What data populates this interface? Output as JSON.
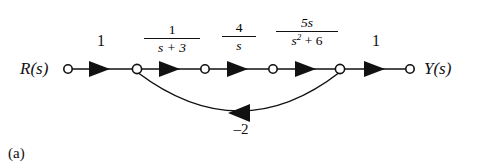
{
  "figure": {
    "caption": "(a)",
    "background": "#ffffff",
    "stroke_color": "#111111"
  },
  "graph": {
    "input_label": "R(s)",
    "output_label": "Y(s)",
    "nodes": [
      {
        "id": "n1",
        "name": "input-node",
        "x": 68,
        "y": 69
      },
      {
        "id": "n2",
        "name": "node-2",
        "x": 137,
        "y": 69
      },
      {
        "id": "n3",
        "name": "node-3",
        "x": 205,
        "y": 69
      },
      {
        "id": "n4",
        "name": "node-4",
        "x": 273,
        "y": 69
      },
      {
        "id": "n5",
        "name": "node-5",
        "x": 340,
        "y": 69
      },
      {
        "id": "n6",
        "name": "output-node",
        "x": 410,
        "y": 69
      }
    ],
    "branches": [
      {
        "from": "n1",
        "to": "n2",
        "gain_type": "simple",
        "gain": "1",
        "label_x": 100,
        "label_y": 40
      },
      {
        "from": "n2",
        "to": "n3",
        "gain_type": "fraction",
        "numerator": "1",
        "denominator": "s + 3",
        "label_x": 171,
        "label_y": 26
      },
      {
        "from": "n3",
        "to": "n4",
        "gain_type": "fraction",
        "numerator": "4",
        "denominator": "s",
        "label_x": 239,
        "label_y": 24
      },
      {
        "from": "n4",
        "to": "n5",
        "gain_type": "fraction",
        "numerator": "5s",
        "denominator_pre": "s",
        "denominator_exp": "2",
        "denominator_post": " + 6",
        "label_x": 307,
        "label_y": 20
      },
      {
        "from": "n5",
        "to": "n6",
        "gain_type": "simple",
        "gain": "1",
        "label_x": 375,
        "label_y": 40
      }
    ],
    "feedback": {
      "from": "n5",
      "to": "n2",
      "gain": "–2",
      "direction": "right-to-left",
      "label_x": 240,
      "label_y": 120
    }
  }
}
